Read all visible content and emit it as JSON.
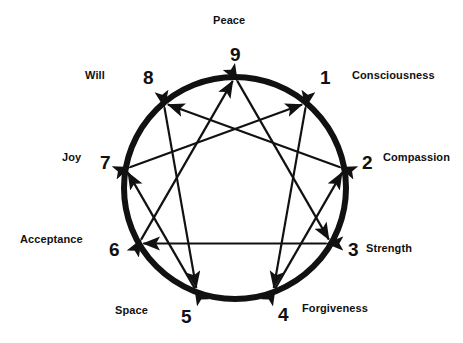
{
  "diagram": {
    "name": "Enneagram",
    "type": "enneagram-symbol",
    "colors": {
      "background": "#ffffff",
      "stroke": "#111111",
      "text": "#111111"
    },
    "geometry": {
      "center_x": 235,
      "center_y": 188,
      "radius": 111,
      "circle_stroke_width": 6,
      "line_stroke_width": 2.2
    },
    "points": [
      {
        "number": "9",
        "word": "Peace",
        "angle_deg": 0,
        "num_x": 230,
        "num_y": 45,
        "word_x": 213,
        "word_y": 15,
        "word_align": "left"
      },
      {
        "number": "1",
        "word": "Consciousness",
        "angle_deg": 40,
        "num_x": 320,
        "num_y": 68,
        "word_x": 352,
        "word_y": 70,
        "word_align": "left"
      },
      {
        "number": "2",
        "word": "Compassion",
        "angle_deg": 80,
        "num_x": 362,
        "num_y": 153,
        "word_x": 383,
        "word_y": 152,
        "word_align": "left"
      },
      {
        "number": "3",
        "word": "Strength",
        "angle_deg": 120,
        "num_x": 348,
        "num_y": 240,
        "word_x": 366,
        "word_y": 243,
        "word_align": "left"
      },
      {
        "number": "4",
        "word": "Forgiveness",
        "angle_deg": 160,
        "num_x": 278,
        "num_y": 305,
        "word_x": 302,
        "word_y": 303,
        "word_align": "left"
      },
      {
        "number": "5",
        "word": "Space",
        "angle_deg": 200,
        "num_x": 181,
        "num_y": 307,
        "word_x": 115,
        "word_y": 305,
        "word_align": "left"
      },
      {
        "number": "6",
        "word": "Acceptance",
        "angle_deg": 240,
        "num_x": 109,
        "num_y": 240,
        "word_x": 20,
        "word_y": 234,
        "word_align": "left"
      },
      {
        "number": "7",
        "word": "Joy",
        "angle_deg": 280,
        "num_x": 100,
        "num_y": 153,
        "word_x": 62,
        "word_y": 152,
        "word_align": "left"
      },
      {
        "number": "8",
        "word": "Will",
        "angle_deg": 320,
        "num_x": 143,
        "num_y": 68,
        "word_x": 85,
        "word_y": 70,
        "word_align": "left"
      }
    ],
    "connections": {
      "triangle": {
        "label": "triangle-9-3-6",
        "sequence": [
          "9",
          "3",
          "6"
        ],
        "arrowheads": "both"
      },
      "hexad": {
        "label": "hexad-1-4-2-8-5-7",
        "sequence": [
          "1",
          "4",
          "2",
          "8",
          "5",
          "7"
        ],
        "arrowheads": "both"
      }
    }
  }
}
